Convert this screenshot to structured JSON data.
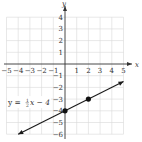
{
  "chart_data": {
    "type": "line",
    "title": "",
    "xlabel": "x",
    "ylabel": "y",
    "xlim": [
      -5,
      5
    ],
    "ylim": [
      -6,
      4
    ],
    "grid": true,
    "x_ticks": [
      "-5",
      "-4",
      "-3",
      "-2",
      "-1",
      "1",
      "2",
      "3",
      "4",
      "5"
    ],
    "y_ticks": [
      "4",
      "3",
      "2",
      "1",
      "-1",
      "-2",
      "-3",
      "-4",
      "-5",
      "-6"
    ],
    "series": [
      {
        "name": "y = 1/2 x - 4",
        "equation": {
          "prefix": "y = ",
          "num": "1",
          "den": "2",
          "suffix": "x − 4"
        },
        "slope": 0.5,
        "intercept": -4,
        "line_from": [
          -4,
          -6
        ],
        "line_to": [
          5,
          -1.5
        ],
        "points": [
          {
            "x": 0,
            "y": -4
          },
          {
            "x": 2,
            "y": -3
          }
        ]
      }
    ]
  },
  "colors": {
    "axis": "#333333",
    "grid": "#d9d9d9",
    "line": "#1a1a1a",
    "point": "#111111"
  }
}
